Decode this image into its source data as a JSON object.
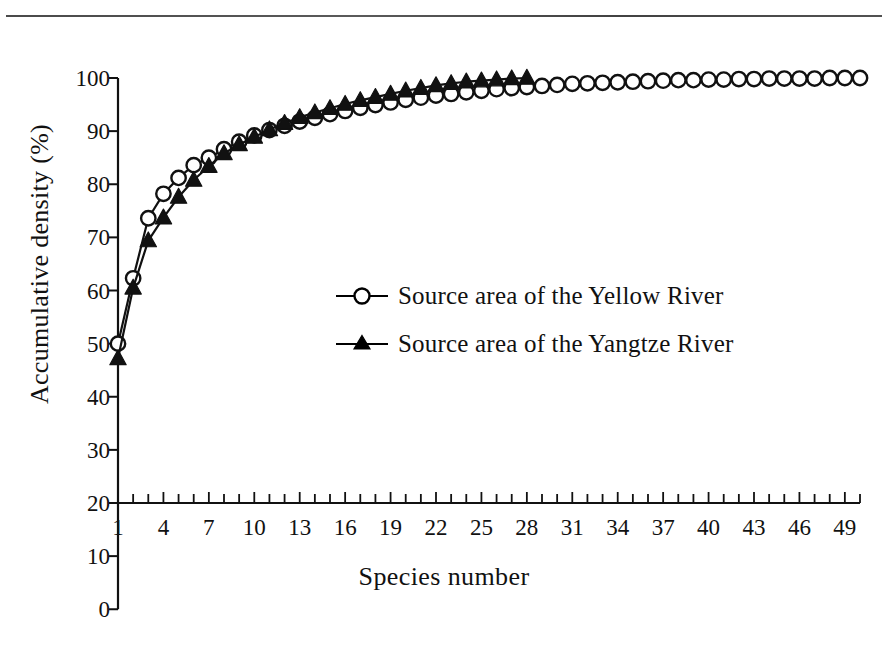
{
  "page": {
    "cutoff_header_text": "",
    "background_color": "#ffffff",
    "ink_color": "#111111"
  },
  "chart_data": {
    "type": "line",
    "title": "",
    "xlabel": "Species number",
    "ylabel": "Accumulative density (%)",
    "xlim": [
      1,
      50
    ],
    "ylim": [
      20,
      100
    ],
    "y_axis_full_range": [
      0,
      100
    ],
    "grid": false,
    "legend_position": "center",
    "y_tick_labels": [
      "100",
      "90",
      "80",
      "70",
      "60",
      "50",
      "40",
      "30",
      "20",
      "10",
      "0"
    ],
    "y_tick_values": [
      100,
      90,
      80,
      70,
      60,
      50,
      40,
      30,
      20,
      10,
      0
    ],
    "x_tick_labels": [
      "1",
      "4",
      "7",
      "10",
      "13",
      "16",
      "19",
      "22",
      "25",
      "28",
      "31",
      "34",
      "37",
      "40",
      "43",
      "46",
      "49"
    ],
    "x_tick_values": [
      1,
      4,
      7,
      10,
      13,
      16,
      19,
      22,
      25,
      28,
      31,
      34,
      37,
      40,
      43,
      46,
      49
    ],
    "x_minor_tick_step": 1,
    "series": [
      {
        "name": "Source area of the Yellow River",
        "marker": "open-circle",
        "color": "#000000",
        "x": [
          1,
          2,
          3,
          4,
          5,
          6,
          7,
          8,
          9,
          10,
          11,
          12,
          13,
          14,
          15,
          16,
          17,
          18,
          19,
          20,
          21,
          22,
          23,
          24,
          25,
          26,
          27,
          28,
          29,
          30,
          31,
          32,
          33,
          34,
          35,
          36,
          37,
          38,
          39,
          40,
          41,
          42,
          43,
          44,
          45,
          46,
          47,
          48,
          49,
          50
        ],
        "values": [
          50.0,
          62.3,
          73.6,
          78.2,
          81.2,
          83.6,
          85.0,
          86.6,
          88.0,
          89.2,
          90.2,
          91.0,
          91.8,
          92.5,
          93.2,
          93.8,
          94.4,
          94.9,
          95.4,
          95.9,
          96.3,
          96.7,
          97.0,
          97.3,
          97.6,
          97.9,
          98.1,
          98.3,
          98.5,
          98.7,
          98.9,
          99.0,
          99.1,
          99.2,
          99.3,
          99.4,
          99.5,
          99.6,
          99.6,
          99.7,
          99.7,
          99.8,
          99.8,
          99.9,
          99.9,
          99.9,
          99.9,
          100.0,
          100.0,
          100.0
        ]
      },
      {
        "name": "Source area of the Yangtze River",
        "marker": "filled-triangle",
        "color": "#000000",
        "x": [
          1,
          2,
          3,
          4,
          5,
          6,
          7,
          8,
          9,
          10,
          11,
          12,
          13,
          14,
          15,
          16,
          17,
          18,
          19,
          20,
          21,
          22,
          23,
          24,
          25,
          26,
          27,
          28
        ],
        "values": [
          47.2,
          60.5,
          69.4,
          73.7,
          77.6,
          80.8,
          83.4,
          85.8,
          87.5,
          88.9,
          90.3,
          91.5,
          92.6,
          93.5,
          94.3,
          95.1,
          95.8,
          96.4,
          97.0,
          97.6,
          98.1,
          98.6,
          99.0,
          99.3,
          99.5,
          99.7,
          99.9,
          100.0
        ]
      }
    ]
  },
  "legend": {
    "items": [
      {
        "label": "Source area of the Yellow River",
        "marker": "open-circle"
      },
      {
        "label": "Source area of the Yangtze River",
        "marker": "filled-triangle"
      }
    ]
  }
}
